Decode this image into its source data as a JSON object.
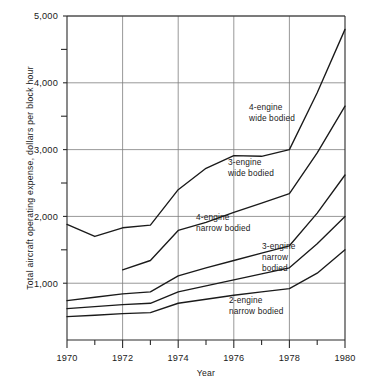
{
  "chart_data": {
    "type": "line",
    "title": "",
    "xlabel": "Year",
    "ylabel": "Total aircraft operating expense, dollars per block hour",
    "xlim": [
      1970,
      1980
    ],
    "ylim": [
      150,
      5000
    ],
    "grid": true,
    "legend_position": "inline-annotations",
    "x_ticks_major": [
      1970,
      1972,
      1974,
      1976,
      1978,
      1980
    ],
    "x_ticks_minor": [
      1971,
      1973,
      1975,
      1977,
      1979
    ],
    "x_tick_labels": [
      "1970",
      "1972",
      "1974",
      "1976",
      "1978",
      "1980"
    ],
    "y_ticks_major": [
      1000,
      2000,
      3000,
      4000,
      5000
    ],
    "y_ticks_minor": [
      1500,
      2500,
      3500,
      4500
    ],
    "y_tick_labels": [
      "1,000",
      "2,000",
      "3,000",
      "4,000",
      "5,000"
    ],
    "series": [
      {
        "name": "4-engine wide bodied",
        "label_lines": [
          "4-engine",
          "wide bodied"
        ],
        "x": [
          1970,
          1971,
          1972,
          1973,
          1974,
          1975,
          1976,
          1977,
          1978,
          1979,
          1980
        ],
        "values": [
          1880,
          1700,
          1830,
          1870,
          2400,
          2720,
          2910,
          2900,
          3000,
          3850,
          4800
        ]
      },
      {
        "name": "3-engine wide bodied",
        "label_lines": [
          "3-engine",
          "wide bodied"
        ],
        "x": [
          1972,
          1973,
          1974,
          1975,
          1976,
          1977,
          1978,
          1979,
          1980
        ],
        "values": [
          1200,
          1340,
          1790,
          1910,
          2060,
          2200,
          2340,
          2950,
          3650
        ]
      },
      {
        "name": "4-engine narrow bodied",
        "label_lines": [
          "4-engine",
          "narrow bodied"
        ],
        "x": [
          1970,
          1971,
          1972,
          1973,
          1974,
          1975,
          1976,
          1977,
          1978,
          1979,
          1980
        ],
        "values": [
          740,
          790,
          840,
          870,
          1110,
          1230,
          1340,
          1450,
          1560,
          2050,
          2620
        ]
      },
      {
        "name": "3-engine narrow bodied",
        "label_lines": [
          "3-engine",
          "narrow",
          "bodied"
        ],
        "x": [
          1970,
          1971,
          1972,
          1973,
          1974,
          1975,
          1976,
          1977,
          1978,
          1979,
          1980
        ],
        "values": [
          620,
          650,
          680,
          700,
          870,
          960,
          1050,
          1140,
          1230,
          1590,
          2000
        ]
      },
      {
        "name": "2-engine narrow bodied",
        "label_lines": [
          "2-engine",
          "narrow bodied"
        ],
        "x": [
          1970,
          1971,
          1972,
          1973,
          1974,
          1975,
          1976,
          1977,
          1978,
          1979,
          1980
        ],
        "values": [
          500,
          520,
          545,
          560,
          700,
          760,
          820,
          870,
          920,
          1150,
          1500
        ]
      }
    ],
    "annotations": [
      {
        "id": "ann-4-wide",
        "lines": [
          "4-engine",
          "wide bodied"
        ],
        "x": 249,
        "y": 110
      },
      {
        "id": "ann-3-wide",
        "lines": [
          "3-engine",
          "wide bodied"
        ],
        "x": 228,
        "y": 165
      },
      {
        "id": "ann-4-narrow",
        "lines": [
          "4-engine",
          "narrow bodied"
        ],
        "x": 196,
        "y": 220
      },
      {
        "id": "ann-3-narrow",
        "lines": [
          "3-engine",
          "narrow",
          "bodied"
        ],
        "x": 262,
        "y": 249
      },
      {
        "id": "ann-2-narrow",
        "lines": [
          "2-engine",
          "narrow bodied"
        ],
        "x": 229,
        "y": 303
      }
    ]
  }
}
